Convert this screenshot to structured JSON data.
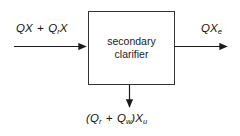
{
  "diagram": {
    "background_color": "#ffffff",
    "line_color": "#333333",
    "text_color": "#111111",
    "unit": {
      "name": "secondary-clarifier",
      "line1": "secondary",
      "line2": "clarifier"
    },
    "streams": {
      "influent": {
        "name": "influent-stream",
        "label_plain": "QX + QrX",
        "term1_base": "QX",
        "operator": " + ",
        "term2_base": "Q",
        "term2_sub": "r",
        "term2_tail": "X",
        "direction": "right",
        "position": "left"
      },
      "effluent": {
        "name": "effluent-stream",
        "label_plain": "QXe",
        "base": "QX",
        "sub": "e",
        "direction": "right",
        "position": "right"
      },
      "underflow": {
        "name": "underflow-stream",
        "label_plain": "(Qr + Qw)Xu",
        "open_paren": "(",
        "term1_base": "Q",
        "term1_sub": "r",
        "operator": " + ",
        "term2_base": "Q",
        "term2_sub": "w",
        "close_paren": ")",
        "term3_base": "X",
        "term3_sub": "u",
        "direction": "down",
        "position": "bottom"
      }
    }
  }
}
